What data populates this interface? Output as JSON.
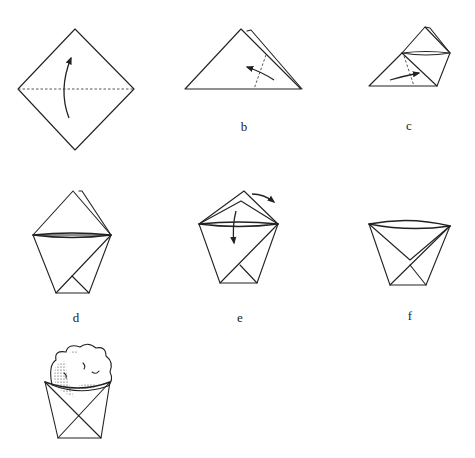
{
  "figure": {
    "type": "origami-instruction-diagram",
    "steps": [
      {
        "id": "a",
        "label": "",
        "description": "Square turned as diamond with horizontal dashed fold line; curved arrow: fold bottom up"
      },
      {
        "id": "b",
        "label": "b",
        "description": "Folded triangle; dashed fold line on right with arrow folding right corner to the left"
      },
      {
        "id": "c",
        "label": "c",
        "description": "Right corner folded over; dashed line on left with arrow folding left corner to the right"
      },
      {
        "id": "d",
        "label": "d",
        "description": "Cup shape with two top flaps"
      },
      {
        "id": "e",
        "label": "e",
        "description": "Fold front flap down and back flap behind (arrows)"
      },
      {
        "id": "f",
        "label": "f",
        "description": "Finished paper cup"
      },
      {
        "id": "g",
        "label": "",
        "description": "Cup filled with a scoop (e.g. ice cream / popcorn)"
      }
    ]
  },
  "stroke_color": "#222222",
  "background_color": "#ffffff"
}
